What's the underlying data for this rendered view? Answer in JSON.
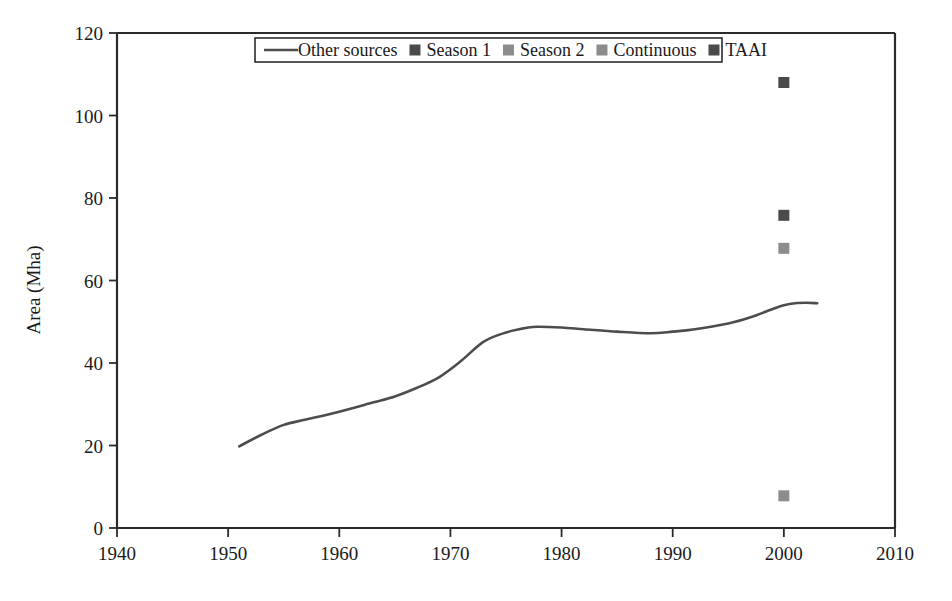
{
  "chart_data": {
    "type": "line",
    "title": "",
    "xlabel": "",
    "ylabel": "Area (Mha)",
    "xlim": [
      1940,
      2010
    ],
    "ylim": [
      0,
      120
    ],
    "xticks": [
      1940,
      1950,
      1960,
      1970,
      1980,
      1990,
      2000,
      2010
    ],
    "yticks": [
      0,
      20,
      40,
      60,
      80,
      100,
      120
    ],
    "grid": false,
    "legend_position": "top-center",
    "series": [
      {
        "name": "Other sources",
        "type": "line",
        "color": "#4d4d4d",
        "x": [
          1951,
          1953,
          1955,
          1957,
          1960,
          1963,
          1965,
          1967,
          1969,
          1971,
          1973,
          1975,
          1977,
          1978,
          1980,
          1982,
          1985,
          1988,
          1990,
          1992,
          1995,
          1997,
          1999,
          2000,
          2001,
          2002,
          2003
        ],
        "values": [
          19.8,
          22.6,
          25.0,
          26.3,
          28.2,
          30.4,
          31.9,
          34.0,
          36.6,
          40.6,
          45.2,
          47.4,
          48.6,
          48.8,
          48.6,
          48.2,
          47.6,
          47.2,
          47.6,
          48.2,
          49.6,
          51.1,
          53.1,
          54.0,
          54.5,
          54.6,
          54.5
        ]
      },
      {
        "name": "Season 1",
        "type": "scatter",
        "color": "#4a4a4a",
        "x": [
          2000
        ],
        "values": [
          75.8
        ]
      },
      {
        "name": "Season 2",
        "type": "scatter",
        "color": "#8c8c8c",
        "x": [
          2000
        ],
        "values": [
          67.8
        ]
      },
      {
        "name": "Continuous",
        "type": "scatter",
        "color": "#8c8c8c",
        "x": [
          2000
        ],
        "values": [
          7.8
        ]
      },
      {
        "name": "TAAI",
        "type": "scatter",
        "color": "#4a4a4a",
        "x": [
          2000
        ],
        "values": [
          108.0
        ]
      }
    ]
  },
  "axes": {
    "y_title": "Area (Mha)",
    "x_tick_labels": [
      "1940",
      "1950",
      "1960",
      "1970",
      "1980",
      "1990",
      "2000",
      "2010"
    ],
    "y_tick_labels": [
      "0",
      "20",
      "40",
      "60",
      "80",
      "100",
      "120"
    ]
  },
  "legend": {
    "items": [
      {
        "label": "Other sources",
        "marker": "line",
        "color": "#4d4d4d"
      },
      {
        "label": "Season 1",
        "marker": "square",
        "color": "#4a4a4a"
      },
      {
        "label": "Season 2",
        "marker": "square",
        "color": "#8c8c8c"
      },
      {
        "label": "Continuous",
        "marker": "square",
        "color": "#8c8c8c"
      },
      {
        "label": "TAAI",
        "marker": "square",
        "color": "#4a4a4a"
      }
    ]
  },
  "colors": {
    "axis": "#2b2b2b",
    "line": "#4d4d4d",
    "dark_marker": "#4a4a4a",
    "light_marker": "#8c8c8c",
    "background": "#ffffff"
  }
}
